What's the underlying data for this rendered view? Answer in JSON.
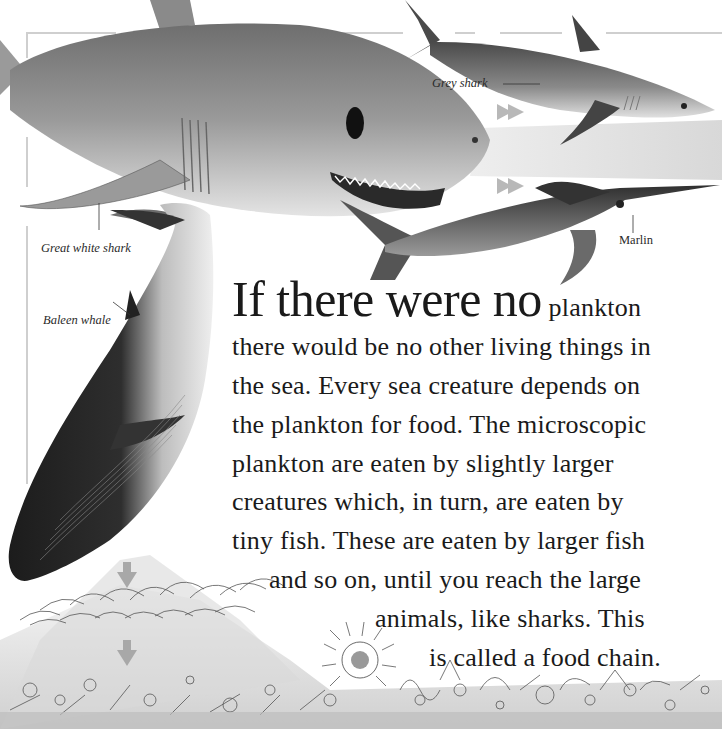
{
  "page": {
    "type": "illustrated book page",
    "theme": "ocean food chain",
    "palette": {
      "background": "#ffffff",
      "frame_line": "#cfcfcf",
      "text": "#1a1a1a",
      "label_text": "#2a2a2a",
      "arrow": "#b8b8b8",
      "light_band": "#e2e2e2"
    }
  },
  "labels": {
    "great_white_shark": "Great white shark",
    "grey_shark": "Grey shark",
    "marlin": "Marlin",
    "baleen_whale": "Baleen whale"
  },
  "body": {
    "headline": "If there were no",
    "lines": [
      "plankton",
      "there would be no other living things in",
      "the sea. Every sea creature depends on",
      "the plankton for food. The microscopic",
      "plankton are eaten by slightly larger",
      "creatures which, in turn, are eaten by",
      "tiny fish. These are eaten by larger fish",
      "and so on, until you reach the large",
      "animals, like sharks. This",
      "is called a food chain."
    ]
  },
  "illustrations": [
    {
      "name": "great-white-shark",
      "position": "top-left"
    },
    {
      "name": "grey-shark",
      "position": "top-right"
    },
    {
      "name": "marlin",
      "position": "middle-right"
    },
    {
      "name": "baleen-whale",
      "position": "left"
    },
    {
      "name": "plankton-bed",
      "position": "bottom"
    }
  ],
  "arrows": [
    {
      "direction": "right",
      "x": 500,
      "y": 112
    },
    {
      "direction": "right",
      "x": 500,
      "y": 186
    },
    {
      "direction": "down",
      "x": 127,
      "y": 570
    },
    {
      "direction": "down",
      "x": 127,
      "y": 648
    }
  ]
}
